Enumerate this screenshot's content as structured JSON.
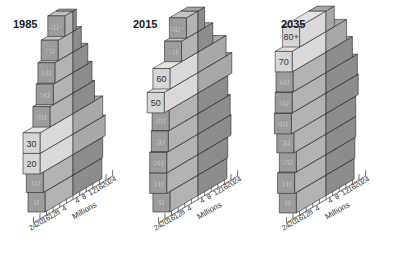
{
  "chart_data": {
    "type": "3d-population-pyramid",
    "title": "",
    "xlabel": "Millions",
    "x_ticks": [
      24,
      20,
      16,
      12,
      8,
      4,
      4,
      8,
      12,
      16,
      20,
      24
    ],
    "xlim": [
      -24,
      24
    ],
    "left_side": "female (lighter)",
    "right_side": "male (darker)",
    "age_groups": [
      "0",
      "10",
      "20",
      "30",
      "40",
      "50",
      "60",
      "70",
      "80+"
    ],
    "pyramids": [
      {
        "year": "1985",
        "left": [
          17,
          18,
          20,
          20,
          14,
          12,
          11,
          9,
          5
        ],
        "right": [
          17.5,
          18,
          19.5,
          18,
          13,
          11.5,
          9,
          5,
          2
        ],
        "highlight": [
          false,
          false,
          true,
          true,
          false,
          false,
          false,
          false,
          false
        ]
      },
      {
        "year": "2015",
        "left": [
          17,
          19,
          19,
          18,
          17.5,
          20.5,
          17,
          10,
          7
        ],
        "right": [
          17.5,
          18,
          20,
          19.5,
          18,
          20.5,
          17,
          9,
          4
        ],
        "highlight": [
          false,
          false,
          false,
          false,
          false,
          true,
          true,
          false,
          false
        ]
      },
      {
        "year": "2035",
        "left": [
          18,
          19,
          18,
          19.5,
          21,
          20.5,
          20,
          20.5,
          16
        ],
        "right": [
          17,
          17.5,
          18,
          18,
          19.5,
          19,
          16,
          12.5,
          5
        ],
        "highlight": [
          false,
          false,
          false,
          false,
          false,
          false,
          false,
          true,
          true
        ]
      }
    ]
  },
  "titles": {
    "p0": "1985",
    "p1": "2015",
    "p2": "2035"
  },
  "axis_label": "Millions",
  "colors": {
    "front": "#9c9c9c",
    "front_hl": "#d6d6d6",
    "top": "#c4c4c4",
    "top_hl": "#e4e4e4",
    "side_left": "#b2b2b2",
    "side_left_hl": "#d9d9d9",
    "side_right": "#8c8c8c",
    "side_right_hl": "#a8a8a8",
    "stroke": "#2a2a2a",
    "label_normal": "#f2f2f2",
    "label_hl": "#333333"
  }
}
